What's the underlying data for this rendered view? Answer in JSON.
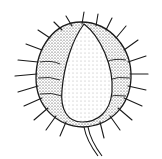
{
  "image": {
    "subject": "spiny seed pod illustration",
    "style": "black and white stipple drawing",
    "colors": {
      "background": "#ffffff",
      "ink": "#1a1a1a",
      "shade": "#555555"
    }
  }
}
